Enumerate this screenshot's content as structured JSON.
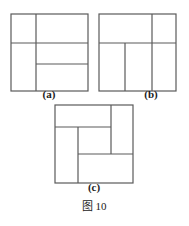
{
  "page": {
    "caption": "图 10",
    "background_color": "#ffffff",
    "line_color": "#5a5a5a",
    "text_color": "#1b1b1b"
  },
  "figures": [
    {
      "id": "a",
      "label": "(a)",
      "description": "square divided into four rectangles",
      "square": {
        "x": 11,
        "y": 14,
        "size": 77
      },
      "lines": [
        {
          "name": "vertical-divider-full",
          "x1": 36,
          "y1": 14,
          "x2": 36,
          "y2": 91
        },
        {
          "name": "horizontal-divider-full",
          "x1": 11,
          "y1": 43,
          "x2": 88,
          "y2": 43
        },
        {
          "name": "horizontal-divider-right",
          "x1": 36,
          "y1": 64,
          "x2": 88,
          "y2": 64
        }
      ],
      "region_count": 4
    },
    {
      "id": "b",
      "label": "(b)",
      "description": "square divided into five rectangles",
      "square": {
        "x": 99,
        "y": 14,
        "size": 77
      },
      "lines": [
        {
          "name": "horizontal-divider-full",
          "x1": 99,
          "y1": 43,
          "x2": 176,
          "y2": 43
        },
        {
          "name": "vertical-divider-top",
          "x1": 152,
          "y1": 14,
          "x2": 152,
          "y2": 43
        },
        {
          "name": "vertical-divider-bottom-left",
          "x1": 125,
          "y1": 43,
          "x2": 125,
          "y2": 91
        },
        {
          "name": "vertical-divider-bottom-right",
          "x1": 152,
          "y1": 43,
          "x2": 152,
          "y2": 91
        }
      ],
      "region_count": 5
    },
    {
      "id": "c",
      "label": "(c)",
      "description": "pinwheel square with central small square",
      "square": {
        "x": 55,
        "y": 105,
        "size": 78
      },
      "lines": [
        {
          "name": "pinwheel-top-horizontal",
          "x1": 55,
          "y1": 127,
          "x2": 111,
          "y2": 127
        },
        {
          "name": "pinwheel-right-vertical",
          "x1": 111,
          "y1": 105,
          "x2": 111,
          "y2": 154
        },
        {
          "name": "pinwheel-bottom-horizontal",
          "x1": 78,
          "y1": 154,
          "x2": 133,
          "y2": 154
        },
        {
          "name": "pinwheel-left-vertical",
          "x1": 78,
          "y1": 127,
          "x2": 78,
          "y2": 183
        }
      ],
      "region_count": 5
    }
  ]
}
